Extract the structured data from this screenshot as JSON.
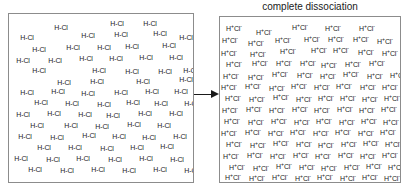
{
  "figure": {
    "caption": "complete dissociation",
    "arrow_icon": "right-arrow-icon",
    "accent_color": "#1a1a1a",
    "border_color": "#8c8c8c",
    "background_color": "#ffffff"
  },
  "left_panel": {
    "label": "undissociated HCl molecules",
    "species_label": "H-Cl",
    "count": 63,
    "positions": [
      [
        52,
        14
      ],
      [
        108,
        10
      ],
      [
        141,
        10
      ],
      [
        201,
        12
      ],
      [
        18,
        24
      ],
      [
        79,
        22
      ],
      [
        112,
        21
      ],
      [
        151,
        20
      ],
      [
        177,
        24
      ],
      [
        30,
        36
      ],
      [
        64,
        34
      ],
      [
        95,
        34
      ],
      [
        123,
        33
      ],
      [
        160,
        32
      ],
      [
        189,
        36
      ],
      [
        217,
        34
      ],
      [
        14,
        47
      ],
      [
        46,
        47
      ],
      [
        77,
        45
      ],
      [
        107,
        45
      ],
      [
        137,
        44
      ],
      [
        167,
        44
      ],
      [
        194,
        45
      ],
      [
        223,
        44
      ],
      [
        30,
        57
      ],
      [
        90,
        57
      ],
      [
        123,
        58
      ],
      [
        156,
        58
      ],
      [
        181,
        57
      ],
      [
        55,
        69
      ],
      [
        88,
        68
      ],
      [
        134,
        68
      ],
      [
        177,
        66
      ],
      [
        206,
        65
      ],
      [
        18,
        79
      ],
      [
        49,
        78
      ],
      [
        79,
        80
      ],
      [
        112,
        79
      ],
      [
        143,
        78
      ],
      [
        172,
        78
      ],
      [
        201,
        80
      ],
      [
        32,
        89
      ],
      [
        63,
        90
      ],
      [
        95,
        91
      ],
      [
        124,
        89
      ],
      [
        152,
        90
      ],
      [
        182,
        90
      ],
      [
        14,
        101
      ],
      [
        45,
        100
      ],
      [
        76,
        101
      ],
      [
        104,
        102
      ],
      [
        136,
        100
      ],
      [
        167,
        100
      ],
      [
        198,
        101
      ],
      [
        28,
        112
      ],
      [
        62,
        112
      ],
      [
        93,
        113
      ],
      [
        125,
        111
      ],
      [
        155,
        112
      ],
      [
        186,
        112
      ],
      [
        16,
        123
      ],
      [
        48,
        124
      ],
      [
        80,
        122
      ],
      [
        110,
        123
      ],
      [
        140,
        124
      ],
      [
        171,
        123
      ],
      [
        200,
        123
      ],
      [
        35,
        134
      ],
      [
        66,
        134
      ],
      [
        98,
        135
      ],
      [
        128,
        134
      ],
      [
        158,
        133
      ],
      [
        190,
        134
      ],
      [
        12,
        145
      ],
      [
        44,
        146
      ],
      [
        74,
        145
      ],
      [
        106,
        146
      ],
      [
        137,
        145
      ],
      [
        168,
        146
      ],
      [
        198,
        145
      ],
      [
        26,
        156
      ],
      [
        58,
        157
      ],
      [
        89,
        156
      ],
      [
        120,
        157
      ],
      [
        151,
        156
      ],
      [
        182,
        157
      ],
      [
        18,
        167
      ],
      [
        50,
        168
      ],
      [
        82,
        167
      ],
      [
        113,
        168
      ],
      [
        144,
        167
      ],
      [
        175,
        168
      ],
      [
        205,
        167
      ]
    ]
  },
  "right_panel": {
    "label": "dissociated ions",
    "species_html": "H<sup>+</sup>Cl<sup>-</sup>",
    "species_text": "H+Cl-",
    "count": 90,
    "positions": [
      [
        14,
        12
      ],
      [
        44,
        16
      ],
      [
        80,
        11
      ],
      [
        113,
        12
      ],
      [
        147,
        12
      ],
      [
        180,
        10
      ],
      [
        10,
        24
      ],
      [
        36,
        27
      ],
      [
        63,
        24
      ],
      [
        92,
        23
      ],
      [
        116,
        23
      ],
      [
        141,
        23
      ],
      [
        165,
        25
      ],
      [
        186,
        22
      ],
      [
        9,
        37
      ],
      [
        38,
        38
      ],
      [
        68,
        35
      ],
      [
        99,
        34
      ],
      [
        121,
        34
      ],
      [
        146,
        36
      ],
      [
        170,
        37
      ],
      [
        192,
        33
      ],
      [
        14,
        48
      ],
      [
        40,
        47
      ],
      [
        64,
        47
      ],
      [
        88,
        47
      ],
      [
        109,
        49
      ],
      [
        133,
        48
      ],
      [
        157,
        47
      ],
      [
        179,
        47
      ],
      [
        11,
        60
      ],
      [
        36,
        61
      ],
      [
        60,
        58
      ],
      [
        85,
        59
      ],
      [
        108,
        60
      ],
      [
        131,
        58
      ],
      [
        155,
        60
      ],
      [
        178,
        59
      ],
      [
        9,
        71
      ],
      [
        33,
        70
      ],
      [
        57,
        72
      ],
      [
        79,
        70
      ],
      [
        102,
        71
      ],
      [
        124,
        70
      ],
      [
        148,
        71
      ],
      [
        170,
        71
      ],
      [
        190,
        69
      ],
      [
        13,
        82
      ],
      [
        37,
        83
      ],
      [
        61,
        81
      ],
      [
        84,
        83
      ],
      [
        106,
        82
      ],
      [
        128,
        82
      ],
      [
        150,
        83
      ],
      [
        172,
        82
      ],
      [
        192,
        81
      ],
      [
        10,
        94
      ],
      [
        34,
        93
      ],
      [
        57,
        94
      ],
      [
        80,
        93
      ],
      [
        102,
        94
      ],
      [
        125,
        93
      ],
      [
        147,
        94
      ],
      [
        169,
        93
      ],
      [
        190,
        94
      ],
      [
        12,
        105
      ],
      [
        36,
        106
      ],
      [
        59,
        105
      ],
      [
        82,
        106
      ],
      [
        104,
        105
      ],
      [
        127,
        106
      ],
      [
        149,
        105
      ],
      [
        171,
        106
      ],
      [
        191,
        105
      ],
      [
        9,
        117
      ],
      [
        33,
        116
      ],
      [
        56,
        117
      ],
      [
        78,
        116
      ],
      [
        101,
        117
      ],
      [
        123,
        116
      ],
      [
        146,
        117
      ],
      [
        168,
        116
      ],
      [
        189,
        117
      ],
      [
        14,
        128
      ],
      [
        38,
        129
      ],
      [
        61,
        127
      ],
      [
        84,
        128
      ],
      [
        106,
        129
      ],
      [
        129,
        128
      ],
      [
        151,
        127
      ],
      [
        173,
        128
      ],
      [
        193,
        129
      ],
      [
        11,
        140
      ],
      [
        35,
        139
      ],
      [
        58,
        140
      ],
      [
        81,
        139
      ],
      [
        103,
        140
      ],
      [
        126,
        139
      ],
      [
        148,
        140
      ],
      [
        170,
        139
      ],
      [
        190,
        140
      ],
      [
        17,
        151
      ],
      [
        41,
        152
      ],
      [
        64,
        150
      ],
      [
        87,
        151
      ],
      [
        109,
        152
      ],
      [
        132,
        151
      ],
      [
        154,
        150
      ],
      [
        176,
        151
      ],
      [
        13,
        161
      ],
      [
        37,
        162
      ],
      [
        60,
        161
      ],
      [
        83,
        162
      ],
      [
        105,
        161
      ],
      [
        128,
        162
      ],
      [
        150,
        161
      ],
      [
        172,
        162
      ],
      [
        192,
        160
      ]
    ]
  }
}
